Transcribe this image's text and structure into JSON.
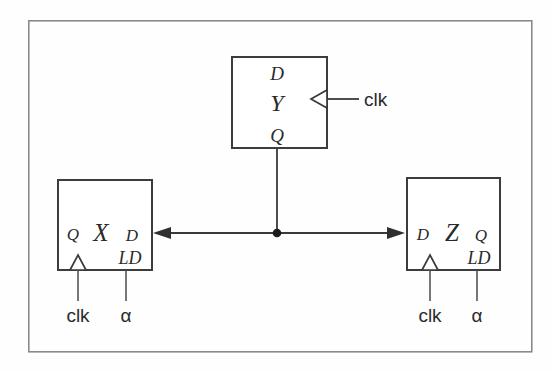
{
  "figure": {
    "frame": {
      "x": 28,
      "y": 20,
      "width": 504,
      "height": 332
    },
    "colors": {
      "background": "#fefefe",
      "frame_stroke": "#8a8a8a",
      "box_stroke": "#3c3c3c",
      "wire_stroke": "#3a3a3a",
      "text": "#2a2a2a",
      "junction": "#1c1c1c"
    }
  },
  "blocks": [
    {
      "id": "block-y",
      "name": "Y",
      "x": 232,
      "y": 57,
      "width": 95,
      "height": 91,
      "center_label": "Y",
      "pins": [
        {
          "name": "D",
          "label": "D",
          "position": "top-center"
        },
        {
          "name": "Q",
          "label": "Q",
          "position": "bottom-center"
        }
      ],
      "clock": {
        "label": "clk",
        "edge": "right",
        "marker": "triangle"
      }
    },
    {
      "id": "block-x",
      "name": "X",
      "x": 58,
      "y": 180,
      "width": 94,
      "height": 90,
      "center_label": "X",
      "pins": [
        {
          "name": "Q",
          "label": "Q",
          "position": "mid-left"
        },
        {
          "name": "D",
          "label": "D",
          "position": "mid-right"
        },
        {
          "name": "LD",
          "label": "LD",
          "position": "lower-right"
        }
      ],
      "clock": {
        "label": "clk",
        "edge": "bottom",
        "marker": "triangle"
      },
      "load": {
        "label": "α"
      }
    },
    {
      "id": "block-z",
      "name": "Z",
      "x": 407,
      "y": 178,
      "width": 93,
      "height": 92,
      "center_label": "Z",
      "pins": [
        {
          "name": "D",
          "label": "D",
          "position": "mid-left"
        },
        {
          "name": "Q",
          "label": "Q",
          "position": "mid-right"
        },
        {
          "name": "LD",
          "label": "LD",
          "position": "lower-right"
        }
      ],
      "clock": {
        "label": "clk",
        "edge": "bottom",
        "marker": "triangle"
      },
      "load": {
        "label": "α"
      }
    }
  ],
  "labels": {
    "y_D": "D",
    "y_center": "Y",
    "y_Q": "Q",
    "y_clk": "clk",
    "x_Q": "Q",
    "x_center": "X",
    "x_D": "D",
    "x_LD": "LD",
    "x_clk": "clk",
    "x_alpha": "α",
    "z_D": "D",
    "z_center": "Z",
    "z_Q": "Q",
    "z_LD": "LD",
    "z_clk": "clk",
    "z_alpha": "α"
  },
  "connections": [
    {
      "id": "y-q-to-bus",
      "from": "block-y.Q",
      "to": "junction",
      "type": "vertical-wire",
      "points": [
        [
          277,
          148
        ],
        [
          277,
          233
        ]
      ]
    },
    {
      "id": "bus-to-x-d",
      "from": "junction",
      "to": "block-x.D",
      "type": "arrow-left",
      "points": [
        [
          277,
          233
        ],
        [
          155,
          233
        ]
      ]
    },
    {
      "id": "bus-to-z-d",
      "from": "junction",
      "to": "block-z.D",
      "type": "arrow-right",
      "points": [
        [
          277,
          233
        ],
        [
          404,
          233
        ]
      ]
    },
    {
      "id": "y-clk-stub",
      "from": "block-y.clk-marker",
      "to": "y_clk_label",
      "type": "horizontal-wire",
      "points": [
        [
          327,
          98
        ],
        [
          358,
          98
        ]
      ]
    },
    {
      "id": "x-clk-stub",
      "from": "block-x.clk-marker",
      "to": "x_clk_label",
      "type": "vertical-wire",
      "points": [
        [
          78,
          270
        ],
        [
          78,
          300
        ]
      ]
    },
    {
      "id": "x-ld-stub",
      "from": "block-x.LD",
      "to": "x_alpha_label",
      "type": "vertical-wire",
      "points": [
        [
          126,
          270
        ],
        [
          126,
          300
        ]
      ]
    },
    {
      "id": "z-clk-stub",
      "from": "block-z.clk-marker",
      "to": "z_clk_label",
      "type": "vertical-wire",
      "points": [
        [
          430,
          270
        ],
        [
          430,
          300
        ]
      ]
    },
    {
      "id": "z-ld-stub",
      "from": "block-z.LD",
      "to": "z_alpha_label",
      "type": "vertical-wire",
      "points": [
        [
          477,
          270
        ],
        [
          477,
          300
        ]
      ]
    }
  ],
  "junction": {
    "x": 277,
    "y": 233,
    "radius": 4.2
  }
}
